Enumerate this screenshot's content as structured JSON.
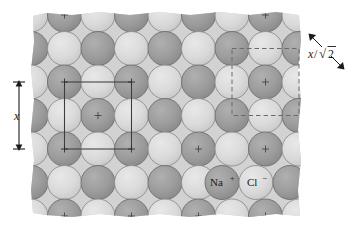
{
  "figure": {
    "type": "crystal-lattice-diagram"
  },
  "colors": {
    "sodium_ion": "#9c9c9c",
    "chloride_ion": "#d9d9d9",
    "background_block": "#d2d2d2",
    "page_background": "#ffffff",
    "outline": "#5a5a5a",
    "annotation": "#1a1a1a",
    "solid_square": "#3d3d3d",
    "dashed_square": "#6b6b6b"
  },
  "ion_labels": {
    "sodium": "Na",
    "sodium_charge": "+",
    "chloride": "Cl",
    "chloride_charge": "−"
  },
  "annotations": {
    "vertical_dimension": "x",
    "diagonal_dimension_numerator": "x",
    "diagonal_dimension_slash": "/",
    "diagonal_dimension_radical": "√",
    "diagonal_dimension_radicand": "2",
    "diagonal_dimension_full": "x/√2"
  },
  "lattice": {
    "sphere_diameter_px": 34,
    "column_spacing_px": 33.5,
    "row_spacing_px": 33.5,
    "rows": 7,
    "cols": 9,
    "pattern": "checkerboard alternating Na+ / Cl-",
    "center_marks": "+"
  },
  "unit_cells": {
    "solid": {
      "style": "solid",
      "label_ref": "x",
      "x": 71,
      "y": 85,
      "size": 67
    },
    "dashed": {
      "style": "dashed",
      "label_ref": "x/√2",
      "x": 228,
      "y": 51,
      "size": 67
    }
  }
}
